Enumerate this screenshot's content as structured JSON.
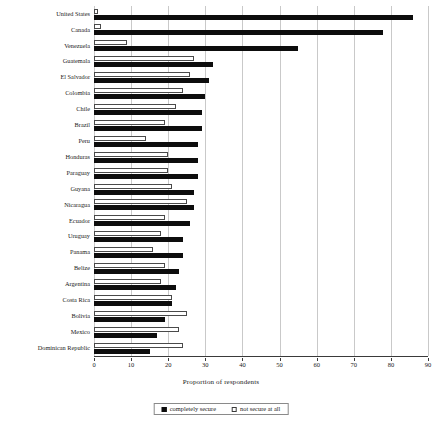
{
  "chart_data": {
    "type": "bar",
    "orientation": "horizontal",
    "title": "",
    "xlabel": "Proportion of respondents",
    "ylabel": "",
    "xlim": [
      0,
      90
    ],
    "xticks": [
      0,
      10,
      20,
      30,
      40,
      50,
      60,
      70,
      80,
      90
    ],
    "grid": true,
    "legend_position": "bottom",
    "categories": [
      "United States",
      "Canada",
      "Venezuela",
      "Guatemala",
      "El Salvador",
      "Colombia",
      "Chile",
      "Brazil",
      "Peru",
      "Honduras",
      "Paraguay",
      "Guyana",
      "Nicaragua",
      "Ecuador",
      "Uruguay",
      "Panama",
      "Belize",
      "Argentina",
      "Costa Rica",
      "Bolivia",
      "Mexico",
      "Dominican Republic"
    ],
    "series": [
      {
        "name": "completely secure",
        "color": "#0d0d0d",
        "values": [
          86,
          78,
          55,
          32,
          31,
          30,
          29,
          29,
          28,
          28,
          28,
          27,
          27,
          26,
          24,
          24,
          23,
          22,
          21,
          19,
          17,
          15
        ]
      },
      {
        "name": "not secure at all",
        "color": "#ffffff",
        "values": [
          1,
          2,
          9,
          27,
          26,
          24,
          22,
          19,
          14,
          20,
          20,
          21,
          25,
          19,
          18,
          16,
          19,
          18,
          21,
          25,
          23,
          24
        ]
      }
    ]
  },
  "axis": {
    "xlabel": "Proportion of respondents",
    "tick_labels": [
      "0",
      "10",
      "20",
      "30",
      "40",
      "50",
      "60",
      "70",
      "80",
      "90"
    ]
  },
  "legend": {
    "items": [
      {
        "label": "completely secure",
        "swatch": "filled-black-square"
      },
      {
        "label": "not secure at all",
        "swatch": "outlined-white-square"
      }
    ]
  }
}
